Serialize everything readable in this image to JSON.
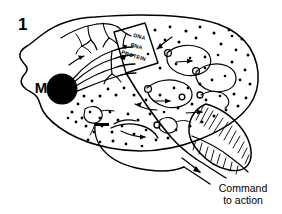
{
  "figure": {
    "panel_number": "1",
    "background_color": "#ffffff",
    "ink_color": "#000000"
  },
  "labels": {
    "motor_soma": "M",
    "central_dogma": {
      "line1": "DNA",
      "line2": "RNA",
      "line3": "PROTEIN"
    },
    "output_caption": {
      "line1": "Command",
      "line2": "to action"
    }
  },
  "parts": {
    "cortex_outline": "cerebral-cortex-outline",
    "motor_neuron_soma": "filled-black-soma-circle",
    "axon_bundle": "curved-axon-fan",
    "dendrite_tree": "branching-dendrite-tree",
    "nucleus_box": "central-dogma-box",
    "circuit_loops": "recurrent-circuit-loops",
    "stipple": "neuropil-dot-field",
    "cerebellum": "hatched-cerebellum",
    "brainstem": "brainstem-output-tract",
    "output_arrow": "descending-command-arrow"
  }
}
